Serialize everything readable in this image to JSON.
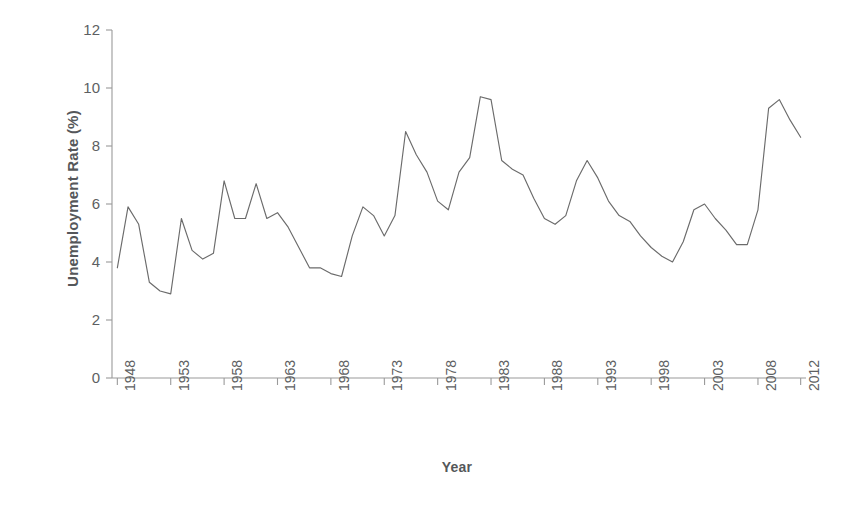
{
  "chart_data": {
    "type": "line",
    "title": "",
    "xlabel": "Year",
    "ylabel": "Unemployment Rate (%)",
    "xlim": [
      1947.5,
      2012.5
    ],
    "ylim": [
      0,
      12
    ],
    "grid": false,
    "legend": null,
    "line_color": "#6b6b6b",
    "axis_color": "#9a9a9a",
    "yticks": [
      0,
      2,
      4,
      6,
      8,
      10,
      12
    ],
    "ytick_labels": [
      "0",
      "2",
      "4",
      "6",
      "8",
      "10",
      "12"
    ],
    "xticks": [
      1948,
      1953,
      1958,
      1963,
      1968,
      1973,
      1978,
      1983,
      1988,
      1993,
      1998,
      2003,
      2008,
      2012
    ],
    "xtick_labels": [
      "1948",
      "1953",
      "1958",
      "1963",
      "1968",
      "1973",
      "1978",
      "1983",
      "1988",
      "1993",
      "1998",
      "2003",
      "2008",
      "2012"
    ],
    "x": [
      1948,
      1949,
      1950,
      1951,
      1952,
      1953,
      1954,
      1955,
      1956,
      1957,
      1958,
      1959,
      1960,
      1961,
      1962,
      1963,
      1964,
      1965,
      1966,
      1967,
      1968,
      1969,
      1970,
      1971,
      1972,
      1973,
      1974,
      1975,
      1976,
      1977,
      1978,
      1979,
      1980,
      1981,
      1982,
      1983,
      1984,
      1985,
      1986,
      1987,
      1988,
      1989,
      1990,
      1991,
      1992,
      1993,
      1994,
      1995,
      1996,
      1997,
      1998,
      1999,
      2000,
      2001,
      2002,
      2003,
      2004,
      2005,
      2006,
      2007,
      2008,
      2009,
      2010,
      2011,
      2012
    ],
    "values": [
      3.8,
      5.9,
      5.3,
      3.3,
      3.0,
      2.9,
      5.5,
      4.4,
      4.1,
      4.3,
      6.8,
      5.5,
      5.5,
      6.7,
      5.5,
      5.7,
      5.2,
      4.5,
      3.8,
      3.8,
      3.6,
      3.5,
      4.9,
      5.9,
      5.6,
      4.9,
      5.6,
      8.5,
      7.7,
      7.1,
      6.1,
      5.8,
      7.1,
      7.6,
      9.7,
      9.6,
      7.5,
      7.2,
      7.0,
      6.2,
      5.5,
      5.3,
      5.6,
      6.8,
      7.5,
      6.9,
      6.1,
      5.6,
      5.4,
      4.9,
      4.5,
      4.2,
      4.0,
      4.7,
      5.8,
      6.0,
      5.5,
      5.1,
      4.6,
      4.6,
      5.8,
      9.3,
      9.6,
      8.9,
      8.3
    ],
    "series_name": "U.S. Unemployment Rate"
  },
  "caption": ""
}
